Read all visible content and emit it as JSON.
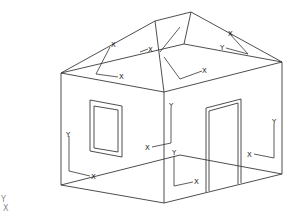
{
  "diagram": {
    "title": "",
    "colors": {
      "background": "#ffffff",
      "lines": "#3a3a3a",
      "axis_labels": "#222222",
      "ucs_icon": "#888888"
    },
    "axis_labels": {
      "x": "X",
      "y": "Y"
    },
    "ucs_icon": {
      "y_label": "Y",
      "x_label": "X"
    },
    "parts": [
      "walls",
      "hip-roof",
      "window",
      "door",
      "face-coordinate-systems"
    ],
    "face_axes": [
      {
        "face": "roof-left",
        "x_label": "X",
        "y_label": "Y"
      },
      {
        "face": "roof-front",
        "x_label": "X",
        "y_label": "Y"
      },
      {
        "face": "roof-right",
        "x_label": "X",
        "y_label": "Y"
      },
      {
        "face": "roof-back",
        "x_label": "X",
        "y_label": "Y"
      },
      {
        "face": "wall-left",
        "x_label": "X",
        "y_label": "Y"
      },
      {
        "face": "wall-left-inner",
        "x_label": "X",
        "y_label": "Y"
      },
      {
        "face": "wall-front",
        "x_label": "X",
        "y_label": "Y"
      },
      {
        "face": "wall-right",
        "x_label": "X",
        "y_label": "Y"
      }
    ]
  }
}
